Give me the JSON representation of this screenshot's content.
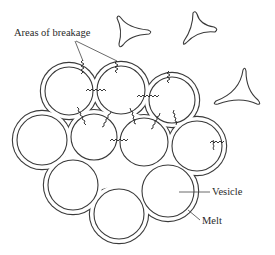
{
  "figure": {
    "labels": {
      "breakage": "Areas of breakage",
      "vesicle": "Vesicle",
      "melt": "Melt"
    },
    "colors": {
      "line": "#3a3a3a",
      "background": "#ffffff"
    },
    "vesicles": [
      {
        "id": "v1",
        "cx": 69,
        "cy": 91,
        "r": 24
      },
      {
        "id": "v2",
        "cx": 121,
        "cy": 90,
        "r": 24
      },
      {
        "id": "v3",
        "cx": 172,
        "cy": 100,
        "r": 23
      },
      {
        "id": "v4",
        "cx": 42,
        "cy": 140,
        "r": 25
      },
      {
        "id": "v5",
        "cx": 94,
        "cy": 137,
        "r": 23
      },
      {
        "id": "v6",
        "cx": 144,
        "cy": 142,
        "r": 24
      },
      {
        "id": "v7",
        "cx": 197,
        "cy": 146,
        "r": 25
      },
      {
        "id": "v8",
        "cx": 73,
        "cy": 185,
        "r": 25
      },
      {
        "id": "v9",
        "cx": 119,
        "cy": 214,
        "r": 25
      },
      {
        "id": "v10",
        "cx": 168,
        "cy": 191,
        "r": 26
      }
    ],
    "shards": [
      {
        "id": "shard-1",
        "tips": [
          [
            117,
            18
          ],
          [
            150,
            31
          ],
          [
            121,
            45
          ]
        ]
      },
      {
        "id": "shard-2",
        "tips": [
          [
            193,
            13
          ],
          [
            217,
            29
          ],
          [
            184,
            43
          ]
        ]
      },
      {
        "id": "shard-3",
        "tips": [
          [
            243,
            70
          ],
          [
            260,
            104
          ],
          [
            215,
            103
          ]
        ]
      }
    ]
  }
}
